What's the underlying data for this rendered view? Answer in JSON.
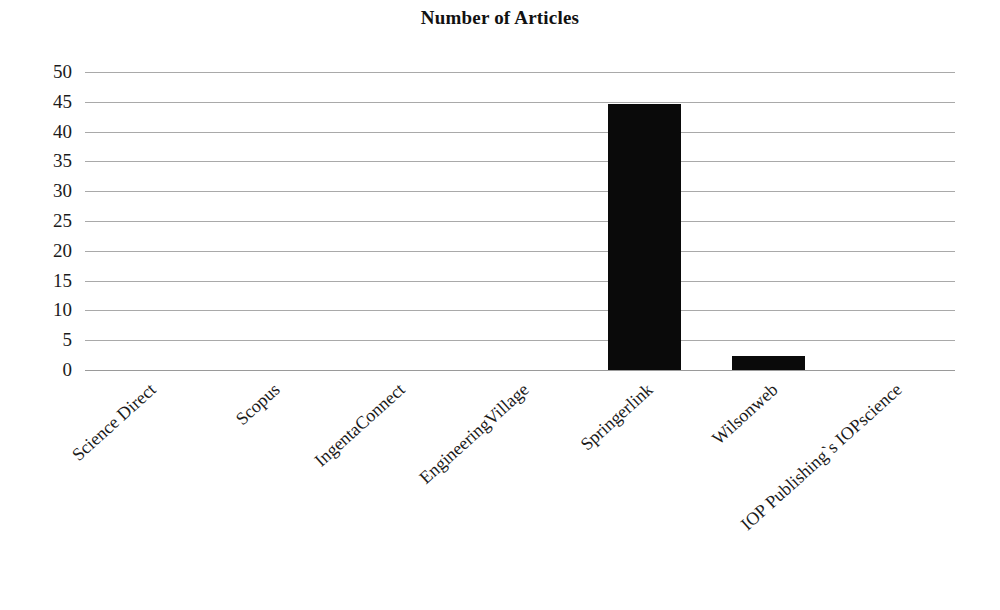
{
  "chart_data": {
    "type": "bar",
    "title": "Number of Articles",
    "xlabel": "",
    "ylabel": "",
    "ylim": [
      0,
      50
    ],
    "ytick_step": 5,
    "yticks": [
      50,
      45,
      40,
      35,
      30,
      25,
      20,
      15,
      10,
      5,
      0
    ],
    "grid": true,
    "legend": false,
    "bar_color": "#0a0a0a",
    "gridline_color": "#a9a9a9",
    "categories": [
      "Science Direct",
      "Scopus",
      "IngentaConnect",
      "EngineeringVillage",
      "Springerlink",
      "Wilsonweb",
      "IOP Publishing`s IOPscience"
    ],
    "values": [
      0,
      0,
      0,
      0,
      44.6,
      2.4,
      0
    ]
  },
  "caption": {
    "partial_text": "…"
  }
}
